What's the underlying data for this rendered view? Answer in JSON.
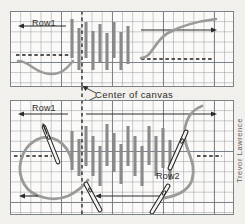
{
  "figure": {
    "medium": "graph-paper",
    "background_color": "#f2f0ec",
    "paper_color": "#fbfaf8",
    "grid_color": "#969ba0",
    "major_grid_color": "#6e767e",
    "stitch_color": "#8a8a8a",
    "thread_color": "#9a9a98",
    "ink_color": "#2b2b2b",
    "credit": "Trevor Lawrence"
  },
  "labels": {
    "center_of_canvas": "Center of canvas",
    "row1_top": "Row1",
    "row1_bottom": "Row1",
    "row2_bottom": "Row2"
  },
  "panels": [
    {
      "name": "top-panel",
      "x": 10,
      "y": 11,
      "width": 224,
      "height": 76,
      "center_line_x": 82,
      "rows": [
        {
          "label": "Row1",
          "direction": "right-to-left",
          "arrow_x1": 66,
          "arrow_x2": 19,
          "arrow_y": 26
        },
        {
          "label": "",
          "direction": "left-to-right",
          "arrow_x1": 141,
          "arrow_x2": 215,
          "arrow_y": 30
        }
      ],
      "dashes": [
        {
          "x1": 16,
          "x2": 73,
          "y": 55
        },
        {
          "x1": 141,
          "x2": 214,
          "y": 59
        }
      ],
      "stitches": [
        {
          "x": 72,
          "y1": 19,
          "y2": 58
        },
        {
          "x": 79,
          "y1": 28,
          "y2": 70
        },
        {
          "x": 86,
          "y1": 22,
          "y2": 58
        },
        {
          "x": 93,
          "y1": 31,
          "y2": 70
        },
        {
          "x": 100,
          "y1": 24,
          "y2": 62
        },
        {
          "x": 107,
          "y1": 33,
          "y2": 70
        },
        {
          "x": 114,
          "y1": 22,
          "y2": 58
        },
        {
          "x": 121,
          "y1": 32,
          "y2": 70
        },
        {
          "x": 128,
          "y1": 26,
          "y2": 64
        }
      ]
    },
    {
      "name": "bottom-panel",
      "x": 10,
      "y": 100,
      "width": 224,
      "height": 115,
      "center_line_x": 82,
      "rows": [
        {
          "label": "Row1",
          "direction": "right-to-left",
          "arrow_x1": 68,
          "arrow_x2": 19,
          "arrow_y": 112
        },
        {
          "label": "",
          "direction": "left-to-right",
          "arrow_x1": 86,
          "arrow_x2": 215,
          "arrow_y": 113
        },
        {
          "label": "Row2",
          "direction": "right-to-left",
          "arrow_x1": 19,
          "arrow_x2": 19,
          "arrow_y": 196
        },
        {
          "label": "",
          "direction": "right-to-left",
          "arrow_x1": 160,
          "arrow_x2": 96,
          "arrow_y": 196
        }
      ],
      "dashes": [
        {
          "x1": 14,
          "x2": 52,
          "y": 156
        },
        {
          "x1": 197,
          "x2": 221,
          "y": 156
        }
      ],
      "stitches": [
        {
          "x": 72,
          "y1": 131,
          "y2": 170
        },
        {
          "x": 79,
          "y1": 139,
          "y2": 176
        },
        {
          "x": 86,
          "y1": 126,
          "y2": 166
        },
        {
          "x": 93,
          "y1": 136,
          "y2": 176
        },
        {
          "x": 100,
          "y1": 146,
          "y2": 186
        },
        {
          "x": 107,
          "y1": 124,
          "y2": 166
        },
        {
          "x": 114,
          "y1": 133,
          "y2": 172
        },
        {
          "x": 121,
          "y1": 144,
          "y2": 184
        },
        {
          "x": 128,
          "y1": 126,
          "y2": 166
        },
        {
          "x": 135,
          "y1": 136,
          "y2": 176
        },
        {
          "x": 142,
          "y1": 146,
          "y2": 186
        },
        {
          "x": 149,
          "y1": 126,
          "y2": 165
        },
        {
          "x": 156,
          "y1": 136,
          "y2": 176
        },
        {
          "x": 163,
          "y1": 128,
          "y2": 168
        },
        {
          "x": 170,
          "y1": 140,
          "y2": 180
        }
      ],
      "needles": [
        {
          "name": "needle-upper-left",
          "x1": 43,
          "y1": 132,
          "x2": 56,
          "y2": 162
        },
        {
          "name": "needle-lower-left",
          "x1": 59,
          "y1": 187,
          "x2": 72,
          "y2": 211
        },
        {
          "name": "needle-upper-right",
          "x1": 183,
          "y1": 137,
          "x2": 168,
          "y2": 168
        },
        {
          "name": "needle-lower-right",
          "x1": 163,
          "y1": 189,
          "x2": 150,
          "y2": 214
        }
      ]
    }
  ]
}
